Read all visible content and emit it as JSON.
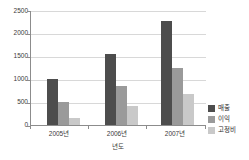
{
  "chart_data": {
    "type": "bar",
    "title": "",
    "subtitle": "",
    "xlabel": "년도",
    "ylabel": "",
    "categories": [
      "2005년",
      "2006년",
      "2007년"
    ],
    "series": [
      {
        "name": "매출",
        "values": [
          1000,
          1550,
          2270
        ],
        "color": "#4d4d4d"
      },
      {
        "name": "이익",
        "values": [
          490,
          840,
          1240
        ],
        "color": "#9a9a9a"
      },
      {
        "name": "고정비",
        "values": [
          150,
          420,
          680
        ],
        "color": "#c9c9c9"
      }
    ],
    "ylim": [
      0,
      2500
    ],
    "yticks": [
      0,
      500,
      1000,
      1500,
      2000,
      2500
    ],
    "ytick_labels": [
      "0",
      "500",
      "1000",
      "1500",
      "2000",
      "2500"
    ],
    "grid": true,
    "grid_axis": "y",
    "legend_position": "right",
    "background_color": "#ffffff",
    "axis_color": "#8c8c8c",
    "grid_color": "#d8d8d8"
  }
}
